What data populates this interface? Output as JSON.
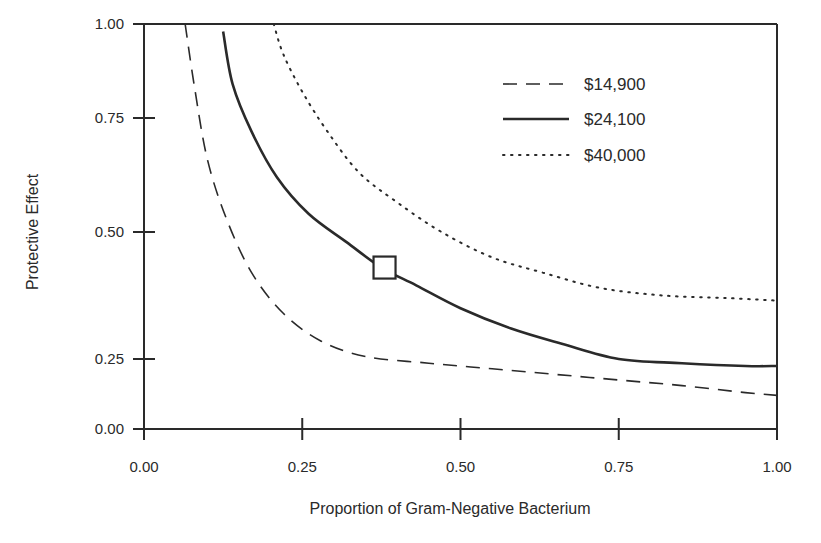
{
  "chart_data": {
    "type": "line",
    "title": "",
    "xlabel": "Proportion of Gram-Negative Bacterium",
    "ylabel": "Protective Effect",
    "xlim": [
      0,
      1
    ],
    "ylim": [
      0,
      1
    ],
    "grid": false,
    "legend_position": "upper right (inside plot)",
    "x_ticks": [
      "0.00",
      "0.25",
      "0.50",
      "0.75",
      "1.00"
    ],
    "y_ticks": [
      "0.00",
      "0.25",
      "0.50",
      "0.75",
      "1.00"
    ],
    "series": [
      {
        "name": "$14,900",
        "style": "dashed",
        "points": [
          [
            0.065,
            1.0
          ],
          [
            0.08,
            0.83
          ],
          [
            0.1,
            0.66
          ],
          [
            0.13,
            0.53
          ],
          [
            0.17,
            0.42
          ],
          [
            0.22,
            0.34
          ],
          [
            0.28,
            0.285
          ],
          [
            0.35,
            0.255
          ],
          [
            0.45,
            0.235
          ],
          [
            0.55,
            0.215
          ],
          [
            0.65,
            0.195
          ],
          [
            0.75,
            0.175
          ],
          [
            0.85,
            0.155
          ],
          [
            0.95,
            0.13
          ],
          [
            1.0,
            0.12
          ]
        ]
      },
      {
        "name": "$24,100",
        "style": "solid",
        "points": [
          [
            0.125,
            0.98
          ],
          [
            0.14,
            0.84
          ],
          [
            0.17,
            0.72
          ],
          [
            0.21,
            0.62
          ],
          [
            0.26,
            0.54
          ],
          [
            0.32,
            0.48
          ],
          [
            0.375,
            0.43
          ],
          [
            0.43,
            0.395
          ],
          [
            0.5,
            0.35
          ],
          [
            0.58,
            0.31
          ],
          [
            0.66,
            0.28
          ],
          [
            0.75,
            0.25
          ],
          [
            0.85,
            0.235
          ],
          [
            0.95,
            0.225
          ],
          [
            1.0,
            0.225
          ]
        ]
      },
      {
        "name": "$40,000",
        "style": "dotted",
        "points": [
          [
            0.205,
            1.0
          ],
          [
            0.22,
            0.92
          ],
          [
            0.25,
            0.82
          ],
          [
            0.29,
            0.72
          ],
          [
            0.34,
            0.63
          ],
          [
            0.4,
            0.565
          ],
          [
            0.47,
            0.5
          ],
          [
            0.55,
            0.45
          ],
          [
            0.63,
            0.42
          ],
          [
            0.72,
            0.39
          ],
          [
            0.82,
            0.375
          ],
          [
            0.92,
            0.37
          ],
          [
            1.0,
            0.365
          ]
        ]
      }
    ],
    "annotations": [
      {
        "type": "square-marker",
        "series": "$24,100",
        "x": 0.38,
        "y": 0.43
      }
    ]
  },
  "axes": {
    "x_title": "Proportion of Gram-Negative Bacterium",
    "y_title": "Protective Effect",
    "x_ticks": [
      "0.00",
      "0.25",
      "0.50",
      "0.75",
      "1.00"
    ],
    "y_ticks": [
      "0.00",
      "0.25",
      "0.50",
      "0.75",
      "1.00"
    ]
  },
  "legend": {
    "items": [
      {
        "label": "$14,900",
        "style": "dashed"
      },
      {
        "label": "$24,100",
        "style": "solid"
      },
      {
        "label": "$40,000",
        "style": "dotted"
      }
    ]
  },
  "colors": {
    "ink": "#2a2a2a",
    "background": "#ffffff"
  }
}
